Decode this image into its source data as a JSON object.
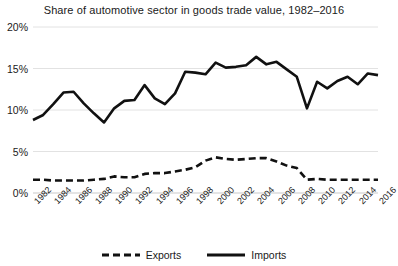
{
  "chart_data": {
    "type": "line",
    "title": "Share of automotive sector in goods trade value, 1982–2016",
    "xlabel": "",
    "ylabel": "",
    "ylim": [
      0,
      20
    ],
    "yticks": [
      0,
      5,
      10,
      15,
      20
    ],
    "ytick_labels": [
      "0%",
      "5%",
      "10%",
      "15%",
      "20%"
    ],
    "grid": true,
    "legend_position": "bottom",
    "x": [
      1982,
      1983,
      1984,
      1985,
      1986,
      1987,
      1988,
      1989,
      1990,
      1991,
      1992,
      1993,
      1994,
      1995,
      1996,
      1997,
      1998,
      1999,
      2000,
      2001,
      2002,
      2003,
      2004,
      2005,
      2006,
      2007,
      2008,
      2009,
      2010,
      2011,
      2012,
      2013,
      2014,
      2015,
      2016
    ],
    "xtick_labels": [
      "1982",
      "1984",
      "1986",
      "1988",
      "1990",
      "1992",
      "1994",
      "1996",
      "1998",
      "2000",
      "2002",
      "2004",
      "2006",
      "2008",
      "2010",
      "2012",
      "2014",
      "2016"
    ],
    "series": [
      {
        "name": "Imports",
        "style": "solid",
        "color": "#111111",
        "values": [
          8.8,
          9.4,
          10.7,
          12.1,
          12.2,
          10.8,
          9.6,
          8.5,
          10.2,
          11.1,
          11.2,
          13.0,
          11.4,
          10.7,
          12.0,
          14.6,
          14.5,
          14.3,
          15.7,
          15.1,
          15.2,
          15.4,
          16.4,
          15.5,
          15.8,
          14.9,
          14.0,
          10.2,
          13.4,
          12.6,
          13.5,
          14.0,
          13.1,
          14.4,
          14.2
        ]
      },
      {
        "name": "Exports",
        "style": "dashed",
        "color": "#111111",
        "values": [
          1.6,
          1.6,
          1.5,
          1.5,
          1.5,
          1.5,
          1.6,
          1.7,
          2.0,
          1.9,
          1.9,
          2.3,
          2.4,
          2.4,
          2.6,
          2.8,
          3.1,
          3.9,
          4.3,
          4.1,
          4.0,
          4.1,
          4.2,
          4.2,
          3.8,
          3.3,
          3.0,
          1.6,
          1.7,
          1.6,
          1.6,
          1.6,
          1.6,
          1.6,
          1.6
        ]
      }
    ],
    "legend": [
      {
        "label": "Exports",
        "style": "dashed"
      },
      {
        "label": "Imports",
        "style": "solid"
      }
    ]
  }
}
